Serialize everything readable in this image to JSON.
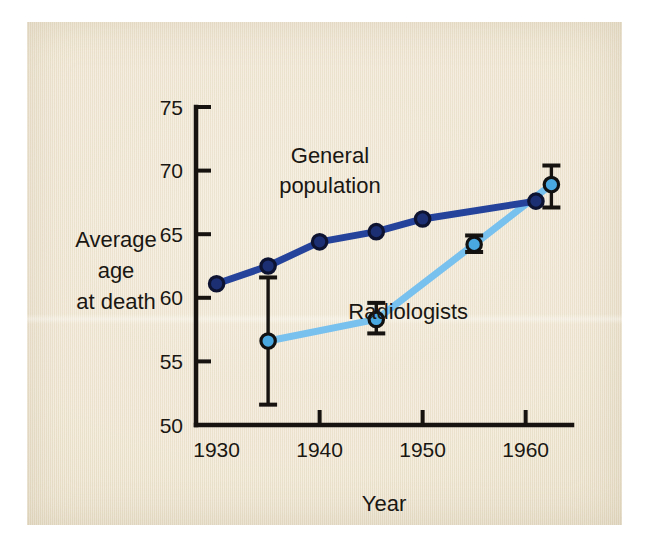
{
  "figure": {
    "background_color": "#f0e6d1",
    "page_color": "#ffffff"
  },
  "chart_data": {
    "type": "line",
    "title": "",
    "xlabel": "Year",
    "ylabel": "Average age at death",
    "ylabel_lines": [
      "Average",
      "age",
      "at death"
    ],
    "xlim": [
      1928.0,
      1964.5
    ],
    "ylim": [
      50,
      75
    ],
    "xticks": [
      1930,
      1940,
      1950,
      1960
    ],
    "xtick_labels": [
      "1930",
      "1940",
      "1950",
      "1960"
    ],
    "yticks": [
      50,
      55,
      60,
      65,
      70,
      75
    ],
    "ytick_labels": [
      "50",
      "55",
      "60",
      "65",
      "70",
      "75"
    ],
    "grid": false,
    "legend": "inline-annotations",
    "series": [
      {
        "name": "General population",
        "color": "#25439b",
        "marker_fill": "#1b2f72",
        "marker_edge": "#0d1330",
        "label_lines": [
          "General",
          "population"
        ],
        "label_x": 1941.0,
        "label_y": 70.6,
        "x": [
          1930.0,
          1935.0,
          1940.0,
          1945.5,
          1950.0,
          1961.0
        ],
        "y": [
          61.1,
          62.5,
          64.4,
          65.2,
          66.2,
          67.6
        ],
        "errors": [
          null,
          null,
          null,
          null,
          null,
          null
        ]
      },
      {
        "name": "Radiologists",
        "color": "#78c0ee",
        "marker_fill": "#4aa8e0",
        "marker_edge": "#111111",
        "label_lines": [
          "Radiologists"
        ],
        "label_x": 1948.6,
        "label_y": 58.3,
        "x": [
          1935.0,
          1945.5,
          1955.0,
          1962.5
        ],
        "y": [
          56.6,
          58.3,
          64.2,
          68.9
        ],
        "errors": [
          {
            "low": 51.6,
            "high": 61.6
          },
          {
            "low": 57.2,
            "high": 59.6
          },
          {
            "low": 63.6,
            "high": 64.9
          },
          {
            "low": 67.1,
            "high": 70.4
          }
        ]
      }
    ]
  }
}
